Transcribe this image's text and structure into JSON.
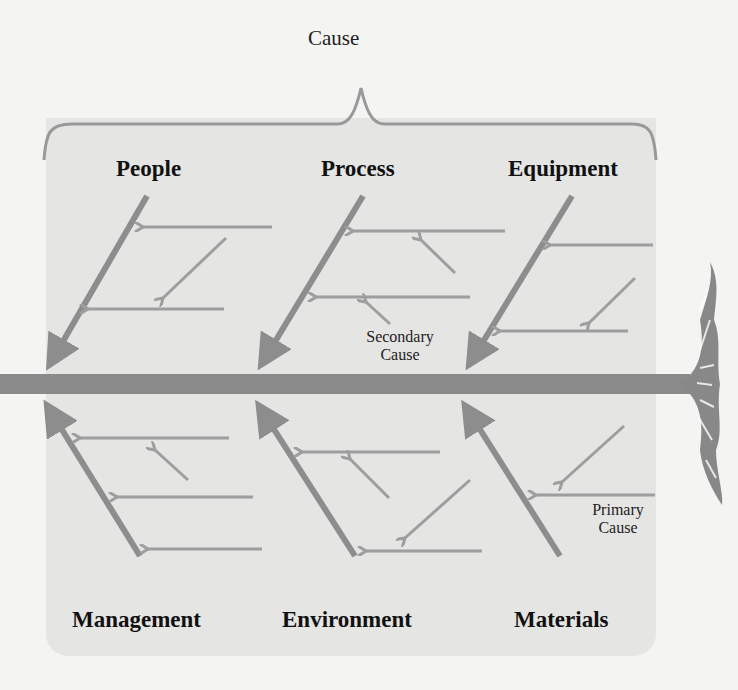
{
  "diagram": {
    "type": "fishbone (Ishikawa) cause-and-effect diagram",
    "title": "Cause",
    "categories_top": [
      "People",
      "Process",
      "Equipment"
    ],
    "categories_bottom": [
      "Management",
      "Environment",
      "Materials"
    ],
    "annotations": {
      "secondary_cause": [
        "Secondary",
        "Cause"
      ],
      "primary_cause": [
        "Primary",
        "Cause"
      ]
    },
    "colors": {
      "background": "#f4f4f3",
      "panel": "#e5e5e4",
      "spine": "#8a8a8a",
      "bone": "#8d8d8d",
      "arrow": "#9e9e9e",
      "text": "#111111"
    }
  }
}
